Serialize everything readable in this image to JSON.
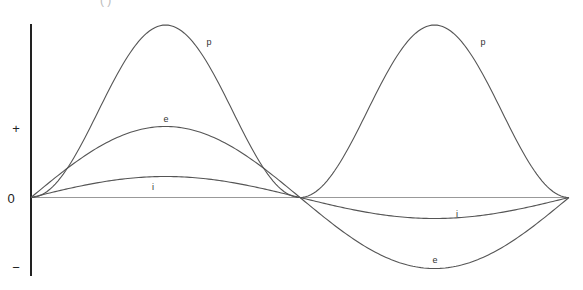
{
  "title_fragment": "(     )",
  "axis": {
    "plus_label": "+",
    "zero_label": "0",
    "minus_label": "−"
  },
  "curves": {
    "p": {
      "label": "p",
      "description": "instantaneous power",
      "peak": 172.5,
      "color": "#555555"
    },
    "e": {
      "label": "e",
      "description": "voltage",
      "amplitude": 71,
      "color": "#555555"
    },
    "i": {
      "label": "i",
      "description": "current",
      "amplitude": 21,
      "color": "#555555"
    }
  },
  "chart_data": {
    "type": "line",
    "title": "",
    "xlabel": "",
    "ylabel": "",
    "x_cycles": 1,
    "y_ticks": [
      "+",
      "0",
      "−"
    ],
    "series": [
      {
        "name": "p",
        "formula": "e*i (sin^2)",
        "relative_amplitude": 1.0,
        "labels_at": [
          [
            209,
            42
          ],
          [
            483,
            42
          ]
        ]
      },
      {
        "name": "e",
        "formula": "sin",
        "relative_amplitude": 0.41,
        "labels_at": [
          [
            166,
            119
          ],
          [
            435,
            260
          ]
        ]
      },
      {
        "name": "i",
        "formula": "sin",
        "relative_amplitude": 0.12,
        "labels_at": [
          [
            153,
            187
          ],
          [
            457,
            214
          ]
        ]
      }
    ],
    "grid": false,
    "legend": "inline labels"
  }
}
